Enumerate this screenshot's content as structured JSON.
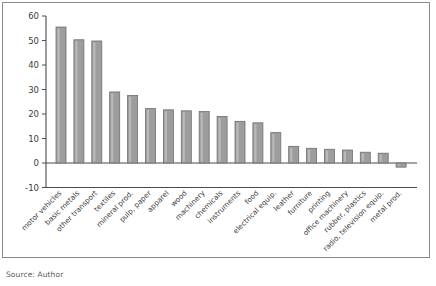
{
  "figure": {
    "source_note": "Source: Author",
    "bar_fill": "#9d9d9d",
    "bar_stroke": "#6e6e6e",
    "frame_color": "#8a8a8a",
    "axis_color": "#4a4a4a"
  },
  "chart_data": {
    "type": "bar",
    "title": "",
    "subtitle": "",
    "xlabel": "",
    "ylabel": "",
    "ylim": [
      -10,
      60
    ],
    "yticks": [
      -10,
      0,
      10,
      20,
      30,
      40,
      50,
      60
    ],
    "ytick_labels": [
      "-10",
      "0",
      "10",
      "20",
      "30",
      "40",
      "50",
      "60"
    ],
    "grid": false,
    "legend": null,
    "legend_position": "none",
    "orientation": "vertical",
    "categories": [
      "motor vehicles",
      "basic metals",
      "other transport",
      "textiles",
      "mineral prod.",
      "pulp, paper",
      "apparel",
      "wood",
      "machinery",
      "chemicals",
      "instruments",
      "food",
      "electrical equip.",
      "leather",
      "furniture",
      "printing",
      "office machinery",
      "rubber, plastics",
      "radio, television equip.",
      "metal prod."
    ],
    "values": [
      55.5,
      50.3,
      49.8,
      29.0,
      27.6,
      22.2,
      21.7,
      21.3,
      21.0,
      19.0,
      17.0,
      16.4,
      12.4,
      6.8,
      6.0,
      5.6,
      5.3,
      4.4,
      4.0,
      -1.7
    ],
    "baseline": 0
  }
}
